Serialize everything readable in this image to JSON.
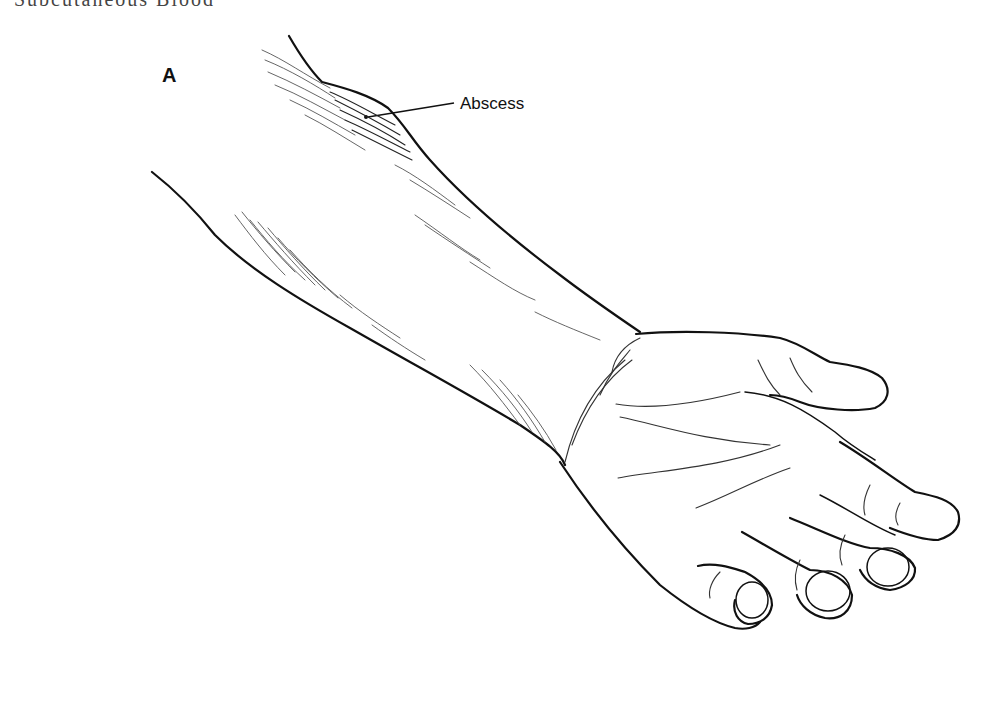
{
  "figure": {
    "clipped_heading": "Subcutaneous Blood",
    "panel_letter": "A",
    "labels": [
      {
        "text": "Abscess",
        "pointer_from": [
          457,
          103
        ],
        "pointer_to": [
          368,
          117
        ]
      }
    ],
    "colors": {
      "line": "#111111",
      "hatching": "#555555",
      "background": "#ffffff"
    }
  }
}
